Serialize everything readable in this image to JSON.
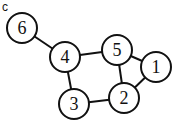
{
  "panel_label": "c",
  "graph": {
    "nodes": [
      {
        "id": "6",
        "label": "6",
        "x": 22,
        "y": 28
      },
      {
        "id": "4",
        "label": "4",
        "x": 65,
        "y": 57
      },
      {
        "id": "5",
        "label": "5",
        "x": 117,
        "y": 50
      },
      {
        "id": "1",
        "label": "1",
        "x": 156,
        "y": 67
      },
      {
        "id": "2",
        "label": "2",
        "x": 124,
        "y": 98
      },
      {
        "id": "3",
        "label": "3",
        "x": 74,
        "y": 104
      }
    ],
    "edges": [
      [
        "6",
        "4"
      ],
      [
        "4",
        "5"
      ],
      [
        "4",
        "3"
      ],
      [
        "3",
        "2"
      ],
      [
        "5",
        "2"
      ],
      [
        "5",
        "1"
      ],
      [
        "1",
        "2"
      ]
    ],
    "node_radius": 15,
    "stroke_color": "#111111",
    "fill_color": "#ffffff"
  }
}
